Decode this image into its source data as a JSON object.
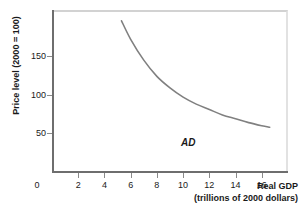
{
  "chart_data": {
    "type": "line",
    "title": "",
    "subtitle": "",
    "xlabel_line1": "Real GDP",
    "xlabel_line2": "(trillions of 2000 dollars)",
    "ylabel": "Price level (2000 = 100)",
    "origin_label": "0",
    "x_ticks": [
      2,
      4,
      6,
      8,
      10,
      12,
      14,
      16
    ],
    "x_tick_labels": [
      "2",
      "4",
      "6",
      "8",
      "10",
      "12",
      "14",
      "16"
    ],
    "y_ticks": [
      50,
      100,
      150
    ],
    "y_tick_labels": [
      "50",
      "100",
      "150"
    ],
    "xlim": [
      0,
      18
    ],
    "ylim": [
      0,
      210
    ],
    "grid": false,
    "legend_position": "inline-right",
    "series": [
      {
        "name": "AD",
        "annotation": "AD",
        "color": "#808080",
        "x": [
          5.3,
          6.0,
          7.0,
          8.0,
          9.0,
          10.0,
          11.0,
          12.0,
          13.0,
          14.0,
          15.0,
          16.0,
          16.6
        ],
        "y": [
          196,
          172,
          145,
          124,
          109,
          97,
          88,
          81,
          74,
          69,
          64,
          60,
          58
        ]
      }
    ]
  },
  "figure": {
    "axis_color": "#6e6e6e",
    "frame_color": "#d2d2d2",
    "curve_color": "#808080",
    "background": "#ffffff"
  }
}
